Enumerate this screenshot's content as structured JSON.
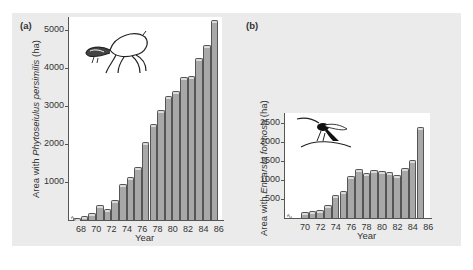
{
  "figure": {
    "panel_a_label": "(a)",
    "panel_b_label": "(b)"
  },
  "chart_data": [
    {
      "type": "bar",
      "panel": "(a)",
      "title": "",
      "xlabel": "Year",
      "ylabel_prefix": "Area with ",
      "ylabel_species": "Phytoseiulus persimilis",
      "ylabel_suffix": " (ha)",
      "ylabel": "Area with Phytoseiulus persimilis (ha)",
      "ylim": [
        0,
        5300
      ],
      "yticks": [
        1000,
        2000,
        3000,
        4000,
        5000
      ],
      "xticks": [
        "68",
        "70",
        "72",
        "74",
        "76",
        "78",
        "80",
        "82",
        "84",
        "86"
      ],
      "categories": [
        "67",
        "68",
        "69",
        "70",
        "71",
        "72",
        "73",
        "74",
        "75",
        "76",
        "77",
        "78",
        "79",
        "80",
        "81",
        "82",
        "83",
        "84",
        "85"
      ],
      "values": [
        10,
        50,
        130,
        330,
        250,
        470,
        900,
        1070,
        1330,
        2000,
        2480,
        2850,
        3200,
        3350,
        3700,
        3730,
        4200,
        4550,
        5200
      ],
      "grid": false,
      "legend": null,
      "illustration": "predatory-mite-drawing"
    },
    {
      "type": "bar",
      "panel": "(b)",
      "title": "",
      "xlabel": "Year",
      "ylabel_prefix": "Area with ",
      "ylabel_species": "Encarsia formosa",
      "ylabel_suffix": " (ha)",
      "ylabel": "Area with Encarsia formosa (ha)",
      "ylim": [
        0,
        2700
      ],
      "yticks": [
        500,
        1000,
        1500,
        2000,
        2500
      ],
      "xticks": [
        "70",
        "72",
        "74",
        "76",
        "78",
        "80",
        "82",
        "84",
        "86"
      ],
      "categories": [
        "70",
        "71",
        "72",
        "73",
        "74",
        "75",
        "76",
        "77",
        "78",
        "79",
        "80",
        "81",
        "82",
        "83",
        "84",
        "85"
      ],
      "values": [
        100,
        130,
        150,
        280,
        550,
        650,
        1050,
        1250,
        1120,
        1220,
        1180,
        1170,
        1070,
        1270,
        1470,
        2330
      ],
      "grid": false,
      "legend": null,
      "illustration": "parasitoid-wasp-drawing"
    }
  ],
  "colors": {
    "panel_bg": "#ebebeb",
    "plot_bg": "#ffffff",
    "bar_fill": "#a8a8a8",
    "bar_top": "#dcdcdc",
    "axis": "#555555"
  }
}
